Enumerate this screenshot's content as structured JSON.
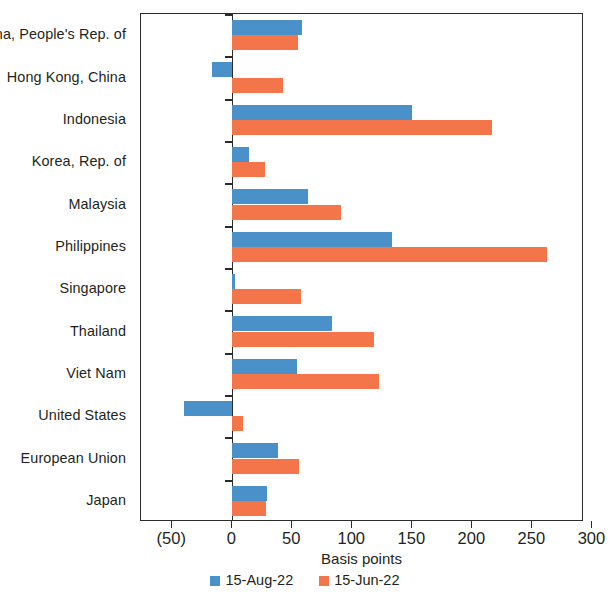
{
  "chart_data": {
    "type": "bar",
    "orientation": "horizontal",
    "title": "",
    "xlabel": "Basis points",
    "ylabel": "",
    "xlim": [
      -76,
      293
    ],
    "xticks": [
      -50,
      0,
      50,
      100,
      150,
      200,
      250,
      300
    ],
    "xticklabels": [
      "(50)",
      "0",
      "50",
      "100",
      "150",
      "200",
      "250",
      "300"
    ],
    "grid": false,
    "legend_position": "bottom-center",
    "categories": [
      "China, People's Rep. of",
      "Hong Kong, China",
      "Indonesia",
      "Korea, Rep. of",
      "Malaysia",
      "Philippines",
      "Singapore",
      "Thailand",
      "Viet Nam",
      "United States",
      "European Union",
      "Japan"
    ],
    "series": [
      {
        "name": "15-Aug-22",
        "color": "#4a90c9",
        "values": [
          58,
          -17,
          150,
          14,
          63,
          133,
          2,
          83,
          54,
          -40,
          38,
          29
        ]
      },
      {
        "name": "15-Jun-22",
        "color": "#f4754a",
        "values": [
          55,
          42,
          216,
          27,
          91,
          262,
          57,
          118,
          122,
          9,
          56,
          28
        ]
      }
    ]
  },
  "legend": {
    "items": [
      {
        "label": "15-Aug-22",
        "color": "#4a90c9"
      },
      {
        "label": "15-Jun-22",
        "color": "#f4754a"
      }
    ]
  },
  "axis": {
    "x_title": "Basis points"
  }
}
